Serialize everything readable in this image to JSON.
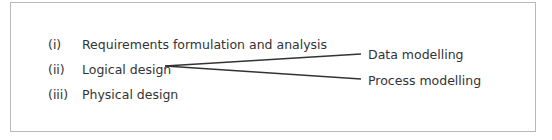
{
  "diagram": {
    "stages": [
      {
        "label": "(i)",
        "text": "Requirements formulation and analysis"
      },
      {
        "label": "(ii)",
        "text": "Logical design"
      },
      {
        "label": "(iii)",
        "text": "Physical design"
      }
    ],
    "branches": [
      {
        "text": "Data modelling"
      },
      {
        "text": "Process modelling"
      }
    ],
    "colors": {
      "border": "#b8b8b8",
      "text": "#333333",
      "line": "#333333"
    }
  }
}
